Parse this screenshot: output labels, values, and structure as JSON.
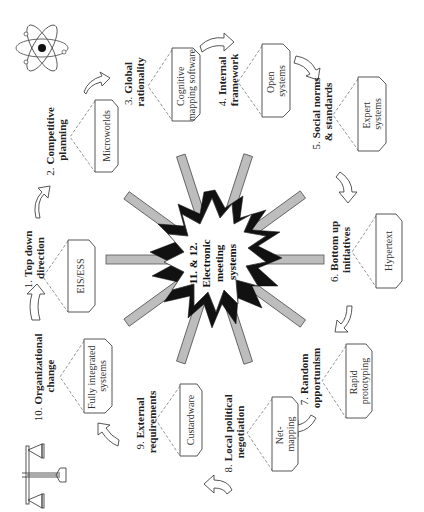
{
  "diagram": {
    "orientation": "rotated-90-clockwise",
    "center": {
      "lines": [
        "11. & 12.",
        "Electronic",
        "meeting",
        "systems"
      ],
      "ray_color": "#bdbdbd",
      "burst_color": "#111111"
    },
    "nodes": [
      {
        "number": "1.",
        "label_lines": [
          "Top down",
          "direction"
        ],
        "box_lines": [
          "EIS/ESS"
        ]
      },
      {
        "number": "2.",
        "label_lines": [
          "Competitive",
          "planning"
        ],
        "box_lines": [
          "Microworlds"
        ]
      },
      {
        "number": "3.",
        "label_lines": [
          "Global",
          "rationality"
        ],
        "box_lines": [
          "Cognitive",
          "mapping software"
        ]
      },
      {
        "number": "4.",
        "label_lines": [
          "Internal",
          "framework"
        ],
        "box_lines": [
          "Open",
          "systems"
        ]
      },
      {
        "number": "5.",
        "label_lines": [
          "Social norms",
          "& standards"
        ],
        "box_lines": [
          "Expert",
          "systems"
        ]
      },
      {
        "number": "6.",
        "label_lines": [
          "Bottom up",
          "initiatives"
        ],
        "box_lines": [
          "Hypertext"
        ]
      },
      {
        "number": "7.",
        "label_lines": [
          "Random",
          "opportunism"
        ],
        "box_lines": [
          "Rapid",
          "prototyping"
        ]
      },
      {
        "number": "8.",
        "label_lines": [
          "Local political",
          "negotiation"
        ],
        "box_lines": [
          "Net-",
          "mapping"
        ]
      },
      {
        "number": "9.",
        "label_lines": [
          "External",
          "requirements"
        ],
        "box_lines": [
          "Custardware"
        ]
      },
      {
        "number": "10.",
        "label_lines": [
          "Organizational",
          "change"
        ],
        "box_lines": [
          "Fully integrated",
          "systems"
        ]
      }
    ],
    "icons": {
      "top_left": "atom-icon",
      "bottom_left": "scales-of-justice-icon"
    }
  }
}
